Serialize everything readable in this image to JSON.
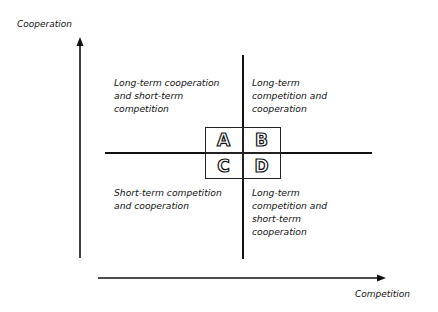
{
  "axes": {
    "y_label": "Cooperation",
    "x_label": "Competition"
  },
  "quadrants": [
    {
      "id": "A",
      "letter": "A",
      "lines": [
        "Long-term cooperation",
        "and short-term",
        "competition"
      ]
    },
    {
      "id": "B",
      "letter": "B",
      "lines": [
        "Long-term",
        "competition and",
        "cooperation"
      ]
    },
    {
      "id": "C",
      "letter": "C",
      "lines": [
        "Short-term competition",
        "and cooperation"
      ]
    },
    {
      "id": "D",
      "letter": "D",
      "lines": [
        "Long-term",
        "competition and",
        "short-term",
        "cooperation"
      ]
    }
  ]
}
